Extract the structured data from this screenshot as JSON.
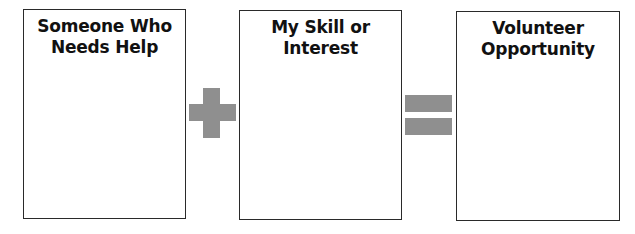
{
  "boxes": [
    {
      "title": "Someone Who\nNeeds Help"
    },
    {
      "title": "My Skill or\nInterest"
    },
    {
      "title": "Volunteer\nOpportunity"
    }
  ],
  "operators": [
    "plus",
    "equals"
  ],
  "colors": {
    "operator": "#8f8f8f",
    "border": "#2a2a2a"
  }
}
